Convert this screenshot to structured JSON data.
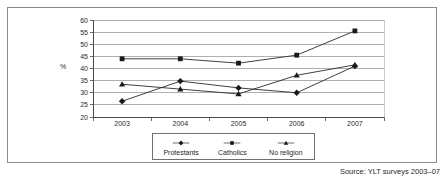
{
  "figure": {
    "y_axis_unit_label": "%",
    "source_caption": "Source: YLT surveys 2003–07"
  },
  "legend": {
    "items": [
      {
        "label": "Protestants",
        "marker": "diamond-marker",
        "color": "#1a1a1a"
      },
      {
        "label": "Catholics",
        "marker": "square-marker",
        "color": "#1a1a1a"
      },
      {
        "label": "No religion",
        "marker": "triangle-marker",
        "color": "#1a1a1a"
      }
    ]
  },
  "chart_data": {
    "type": "line",
    "title": "",
    "subtitle": "",
    "xlabel": "",
    "ylabel": "%",
    "categories": [
      "2003",
      "2004",
      "2005",
      "2006",
      "2007"
    ],
    "x": [
      2003,
      2004,
      2005,
      2006,
      2007
    ],
    "ylim": [
      20,
      60
    ],
    "yticks": [
      20,
      25,
      30,
      35,
      40,
      45,
      50,
      55,
      60
    ],
    "ytick_labels": [
      "20",
      "25",
      "30",
      "35",
      "40",
      "45",
      "50",
      "55",
      "60"
    ],
    "grid": "horizontal",
    "legend_position": "bottom",
    "series": [
      {
        "name": "Protestants",
        "marker": "diamond",
        "values": [
          26.5,
          34.8,
          32.0,
          30.0,
          41.0
        ]
      },
      {
        "name": "Catholics",
        "marker": "square",
        "values": [
          44.0,
          44.0,
          42.2,
          45.5,
          55.5
        ]
      },
      {
        "name": "No religion",
        "marker": "triangle",
        "values": [
          33.5,
          31.5,
          29.5,
          37.2,
          41.5
        ]
      }
    ],
    "annotations": [
      "Source: YLT surveys 2003–07"
    ]
  }
}
